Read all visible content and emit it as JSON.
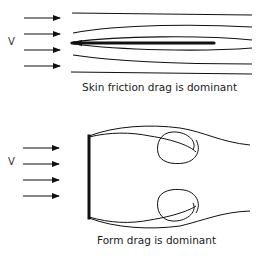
{
  "panels": [
    {
      "id": "skin-friction",
      "velocity_label": "V",
      "caption": "Skin friction drag is dominant",
      "body": "thin flat plate aligned with flow",
      "arrows": 4
    },
    {
      "id": "form-drag",
      "velocity_label": "V",
      "caption": "Form drag is dominant",
      "body": "flat plate perpendicular to flow with wake vortices",
      "arrows": 4
    }
  ],
  "colors": {
    "line": "#111111",
    "text": "#222222",
    "background": "#ffffff"
  }
}
